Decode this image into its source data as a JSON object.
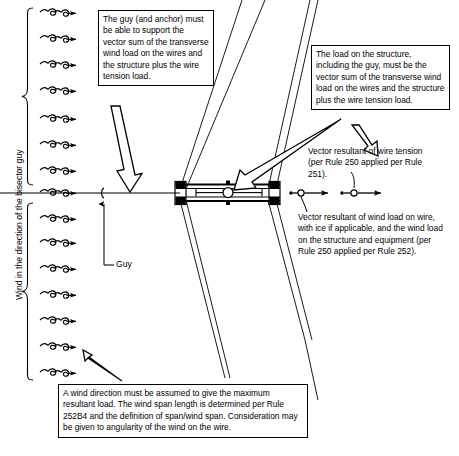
{
  "diagram": {
    "title": "Wind in the direction of the bisector guy",
    "axis_label": "Wind in the direction of the bisector guy",
    "guy_label": "Guy",
    "callouts": [
      {
        "id": "guy-anchor-callout",
        "text": "The guy (and anchor) must be able to support the vector sum of the transverse wind load on the wires and the structure plus the wire tension load."
      },
      {
        "id": "structure-load-callout",
        "text": "The load on the structure, including the guy, must be the vector sum of the transverse wind load on the wires and the structure plus the wire tension load."
      },
      {
        "id": "wind-direction-callout",
        "text": "A wind direction must be assumed to give the maximum resultant load. The wind span length is determined per Rule 252B4 and the definition of span/wind span. Consideration may be given to angularity of the wind on the wire."
      }
    ],
    "annotations": [
      {
        "id": "wire-tension-annotation",
        "text": "Vector resultant of wire tension (per Rule 250 applied per Rule 251)."
      },
      {
        "id": "wind-load-annotation",
        "text": "Vector resultant of wind load on wire, with ice if applicable, and the wind load on the structure and equipment (per Rule 250 applied per Rule 252)."
      }
    ],
    "wind_arrows": {
      "count": 15,
      "symbol": "wind-arrow-icon",
      "y_positions": [
        12,
        38,
        64,
        90,
        118,
        144,
        170,
        192,
        218,
        242,
        268,
        294,
        320,
        346,
        372
      ]
    },
    "structure": {
      "name": "h-frame-structure-plan-view",
      "poles": 2,
      "crossarms": 2
    },
    "vectors": [
      {
        "id": "wind-load-vector",
        "name": "resultant-wind-load-vector"
      },
      {
        "id": "wire-tension-vector",
        "name": "resultant-wire-tension-vector"
      }
    ],
    "colors": {
      "line": "#000000",
      "background": "#ffffff"
    }
  }
}
